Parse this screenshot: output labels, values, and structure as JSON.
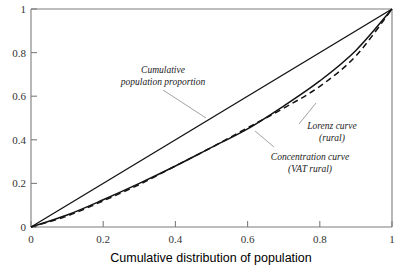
{
  "chart_data": {
    "type": "line",
    "title": "",
    "xlabel": "Cumulative distribution of population",
    "ylabel": "",
    "xlim": [
      0,
      1
    ],
    "ylim": [
      0,
      1
    ],
    "xticks": [
      "0",
      "0.2",
      "0.4",
      "0.6",
      "0.8",
      "1"
    ],
    "yticks": [
      "0",
      "0.2",
      "0.4",
      "0.6",
      "0.8",
      "1"
    ],
    "grid": false,
    "legend_position": "inline-annotations",
    "x": [
      0,
      0.1,
      0.2,
      0.3,
      0.4,
      0.5,
      0.6,
      0.7,
      0.8,
      0.9,
      1.0
    ],
    "series": [
      {
        "name": "Cumulative population proportion",
        "style": "solid",
        "values": [
          0,
          0.1,
          0.2,
          0.3,
          0.4,
          0.5,
          0.6,
          0.7,
          0.8,
          0.9,
          1.0
        ]
      },
      {
        "name": "Lorenz curve (rural)",
        "style": "solid",
        "values": [
          0,
          0.055,
          0.125,
          0.2,
          0.28,
          0.365,
          0.45,
          0.555,
          0.67,
          0.81,
          1.0
        ]
      },
      {
        "name": "Concentration curve (VAT rural)",
        "style": "dashed",
        "values": [
          0,
          0.05,
          0.12,
          0.195,
          0.28,
          0.365,
          0.455,
          0.545,
          0.645,
          0.785,
          1.0
        ]
      }
    ],
    "annotations": [
      {
        "id": "cumulative-population-proportion",
        "line1": "Cumulative",
        "line2": "population proportion",
        "points_to_series": "Cumulative population proportion"
      },
      {
        "id": "lorenz-curve",
        "line1": "Lorenz curve",
        "line2": "(rural)",
        "points_to_series": "Lorenz curve (rural)"
      },
      {
        "id": "concentration-curve",
        "line1": "Concentration curve",
        "line2": "(VAT rural)",
        "points_to_series": "Concentration curve (VAT rural)"
      }
    ]
  },
  "colors": {
    "background": "#ffffff",
    "curve": "#141414",
    "axis": "#7d7d7d",
    "text": "#000000",
    "leader": "#8a8a8a"
  }
}
